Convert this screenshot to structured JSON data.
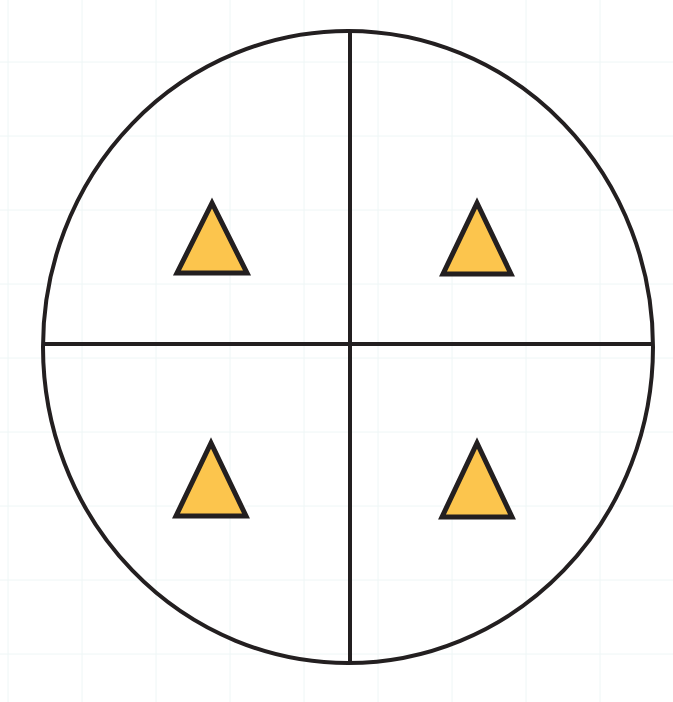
{
  "diagram": {
    "type": "circle-divided-into-quarters",
    "background": "#ffffff",
    "grid_color": "#eef6f6",
    "grid_spacing": 74,
    "circle": {
      "cx": 348,
      "cy": 347,
      "rx": 305,
      "ry": 316,
      "stroke": "#231f20",
      "stroke_width": 4
    },
    "dividers": {
      "vertical": {
        "x1": 350,
        "y1": 31,
        "x2": 350,
        "y2": 663
      },
      "horizontal": {
        "x1": 44,
        "y1": 344,
        "x2": 653,
        "y2": 344
      },
      "stroke": "#231f20",
      "stroke_width": 4
    },
    "shapes": [
      {
        "quadrant": "top-left",
        "shape": "triangle",
        "points": "212,203 177,273 247,273"
      },
      {
        "quadrant": "top-right",
        "shape": "triangle",
        "points": "477,203 443,274 511,274"
      },
      {
        "quadrant": "bottom-left",
        "shape": "triangle",
        "points": "211,443 176,516 246,516"
      },
      {
        "quadrant": "bottom-right",
        "shape": "triangle",
        "points": "477,443 442,517 512,517"
      }
    ],
    "shape_fill": "#fcc54d",
    "shape_stroke": "#231f20",
    "shape_stroke_width": 5
  }
}
